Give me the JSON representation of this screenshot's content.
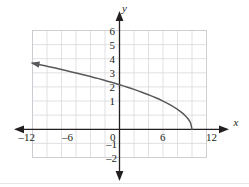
{
  "figure": {
    "kind": "cartesian-graph",
    "background_color": "#ffffff",
    "grid_color": "#d9d9dd",
    "axis_color": "#231f20",
    "curve_color": "#58595b"
  },
  "axes": {
    "x_label": "x",
    "y_label": "y",
    "x_tick_labels": [
      "–12",
      "–6",
      "0",
      "6",
      "12"
    ],
    "x_tick_values": [
      -12,
      -6,
      0,
      6,
      12
    ],
    "y_tick_labels": [
      "6",
      "5",
      "4",
      "3",
      "2",
      "1",
      "–1",
      "–2"
    ],
    "y_tick_values": [
      6,
      5,
      4,
      3,
      2,
      1,
      -1,
      -2
    ],
    "origin_label": "0"
  },
  "chart_data": {
    "type": "line",
    "title": "",
    "xlabel": "x",
    "ylabel": "y",
    "xlim": [
      -12,
      12
    ],
    "ylim": [
      -2,
      6
    ],
    "grid": true,
    "grid_step_x": 2,
    "grid_step_y": 1,
    "legend": null,
    "series": [
      {
        "name": "y = sqrt(10 - x)",
        "endpoint_right": [
          10,
          0
        ],
        "arrow_end": "upper-left",
        "x": [
          -12,
          -11,
          -10,
          -9,
          -8,
          -7,
          -6,
          -5,
          -4,
          -3,
          -2,
          -1,
          0,
          1,
          2,
          3,
          4,
          5,
          6,
          7,
          8,
          8.5,
          9,
          9.5,
          9.8,
          10
        ],
        "values": [
          4.69,
          4.58,
          4.47,
          4.36,
          4.24,
          4.12,
          4.0,
          3.87,
          3.74,
          3.61,
          3.46,
          3.32,
          3.16,
          3.0,
          2.83,
          2.65,
          2.45,
          2.24,
          2.0,
          1.73,
          1.41,
          1.22,
          1.0,
          0.71,
          0.45,
          0.0
        ]
      }
    ]
  }
}
